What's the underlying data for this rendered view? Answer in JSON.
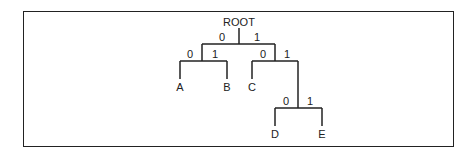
{
  "diagram": {
    "type": "binary-tree",
    "root_label": "ROOT",
    "edge_labels": {
      "root_left": "0",
      "root_right": "1",
      "n1_left": "0",
      "n1_right": "1",
      "n2_left": "0",
      "n2_right": "1",
      "n3_left": "0",
      "n3_right": "1"
    },
    "leaves": {
      "a": "A",
      "b": "B",
      "c": "C",
      "d": "D",
      "e": "E"
    },
    "codes": {
      "A": "00",
      "B": "01",
      "C": "10",
      "D": "110",
      "E": "111"
    }
  }
}
